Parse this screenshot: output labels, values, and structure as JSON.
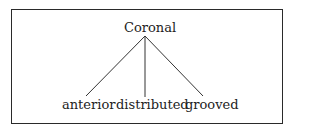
{
  "diagram": {
    "root": {
      "label": "Coronal"
    },
    "children": [
      {
        "label": "anterior"
      },
      {
        "label": "distributed"
      },
      {
        "label": "grooved"
      }
    ],
    "colors": {
      "line": "#333333",
      "text": "#222222",
      "border": "#2a2a2a"
    }
  }
}
